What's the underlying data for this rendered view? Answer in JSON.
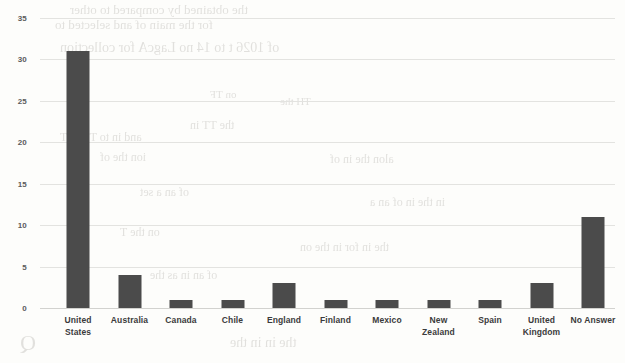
{
  "chart_data": {
    "type": "bar",
    "title": "",
    "subtitle": "",
    "xlabel": "",
    "ylabel": "",
    "categories": [
      "United States",
      "Australia",
      "Canada",
      "Chile",
      "England",
      "Finland",
      "Mexico",
      "New Zealand",
      "Spain",
      "United Kingdom",
      "No Answer"
    ],
    "category_lines": [
      [
        "United",
        "States"
      ],
      [
        "Australia"
      ],
      [
        "Canada"
      ],
      [
        "Chile"
      ],
      [
        "England"
      ],
      [
        "Finland"
      ],
      [
        "Mexico"
      ],
      [
        "New",
        "Zealand"
      ],
      [
        "Spain"
      ],
      [
        "United",
        "Kingdom"
      ],
      [
        "No Answer"
      ]
    ],
    "values": [
      31,
      4,
      1,
      1,
      3,
      1,
      1,
      1,
      1,
      3,
      11
    ],
    "ylim": [
      0,
      35
    ],
    "ytick_labels": [
      "0",
      "5",
      "10",
      "15",
      "20",
      "25",
      "30",
      "35"
    ],
    "ytick_values": [
      0,
      5,
      10,
      15,
      20,
      25,
      30,
      35
    ],
    "grid": true,
    "legend": false,
    "legend_position": "none",
    "bar_color": "#4b4b4b",
    "gridline_color": "#e3e3e0",
    "background_color": "#fdfdfb",
    "axis_text_color": "#3b3b3b"
  },
  "scan_artifacts": {
    "note": "faint bleed-through text from reverse side of scanned page",
    "ghost_text": [
      "the obtained by compared to other",
      "for the main of and selected to",
      "of 1026 t to 14 no LagcA for collection",
      "on TF",
      "TH the",
      "the TT in",
      "and in to TT in T",
      "ion the of",
      "alon the in of",
      "of an a set",
      "in the in of an a",
      "on the T",
      "the in for in the on",
      "of an in as the",
      "Q",
      "the in in the"
    ]
  }
}
